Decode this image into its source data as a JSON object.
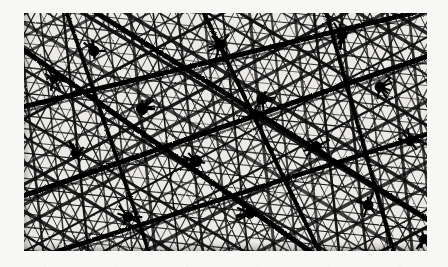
{
  "page": {
    "background_color": "#f7f7f5",
    "photo": {
      "alt_description": "Dense triangulated space-frame truss photographed from below",
      "subject": "space-frame lattice truss",
      "rendering": "high-contrast black and white photograph",
      "frame_color": "#ececea",
      "strut_color": "#111111",
      "bounds_px": {
        "x": 24,
        "y": 13,
        "width": 403,
        "height": 238
      }
    }
  },
  "chart_data": {
    "type": "scatter",
    "title": "",
    "xlabel": "",
    "ylabel": "",
    "grid": false,
    "legend": "none",
    "xlim": [
      0,
      403
    ],
    "ylim": [
      0,
      238
    ],
    "families": [
      {
        "name": "chord-family-a",
        "angle_deg": -28,
        "spacing_px": 19,
        "thickness_px": 2.6,
        "count": 26
      },
      {
        "name": "chord-family-b",
        "angle_deg": 31,
        "spacing_px": 20,
        "thickness_px": 2.6,
        "count": 26
      },
      {
        "name": "chord-family-c",
        "angle_deg": 84,
        "spacing_px": 23,
        "thickness_px": 2.2,
        "count": 22
      },
      {
        "name": "brace-family-d",
        "angle_deg": -62,
        "spacing_px": 11,
        "thickness_px": 1.1,
        "count": 48
      },
      {
        "name": "brace-family-e",
        "angle_deg": 64,
        "spacing_px": 11,
        "thickness_px": 1.1,
        "count": 48
      },
      {
        "name": "brace-family-f",
        "angle_deg": 6,
        "spacing_px": 12,
        "thickness_px": 1.0,
        "count": 34
      }
    ],
    "major_struts": [
      {
        "x1": -10,
        "y1": 96,
        "x2": 413,
        "y2": -6,
        "thickness_px": 5.0
      },
      {
        "x1": -10,
        "y1": 186,
        "x2": 413,
        "y2": 40,
        "thickness_px": 5.4
      },
      {
        "x1": -10,
        "y1": 252,
        "x2": 413,
        "y2": 118,
        "thickness_px": 4.6
      },
      {
        "x1": -10,
        "y1": 30,
        "x2": 300,
        "y2": 248,
        "thickness_px": 5.2
      },
      {
        "x1": 60,
        "y1": -8,
        "x2": 413,
        "y2": 212,
        "thickness_px": 4.8
      },
      {
        "x1": 176,
        "y1": -8,
        "x2": 300,
        "y2": 248,
        "thickness_px": 4.2
      },
      {
        "x1": 300,
        "y1": -8,
        "x2": 372,
        "y2": 248,
        "thickness_px": 3.8
      },
      {
        "x1": 40,
        "y1": -8,
        "x2": 128,
        "y2": 248,
        "thickness_px": 3.6
      }
    ],
    "nodes": [
      {
        "x": 70,
        "y": 38,
        "r": 5.0
      },
      {
        "x": 196,
        "y": 32,
        "r": 5.4
      },
      {
        "x": 318,
        "y": 22,
        "r": 5.0
      },
      {
        "x": 118,
        "y": 96,
        "r": 5.6
      },
      {
        "x": 238,
        "y": 86,
        "r": 5.2
      },
      {
        "x": 356,
        "y": 74,
        "r": 5.0
      },
      {
        "x": 52,
        "y": 140,
        "r": 4.8
      },
      {
        "x": 172,
        "y": 148,
        "r": 5.6
      },
      {
        "x": 292,
        "y": 134,
        "r": 5.4
      },
      {
        "x": 386,
        "y": 128,
        "r": 4.6
      },
      {
        "x": 104,
        "y": 204,
        "r": 5.0
      },
      {
        "x": 226,
        "y": 200,
        "r": 5.2
      },
      {
        "x": 344,
        "y": 192,
        "r": 5.0
      },
      {
        "x": 30,
        "y": 66,
        "r": 4.2
      },
      {
        "x": 400,
        "y": 226,
        "r": 4.4
      }
    ]
  }
}
